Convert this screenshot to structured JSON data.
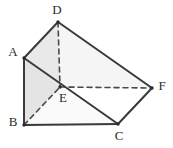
{
  "figure": {
    "kind": "triangular-prism-diagram",
    "background_color": "#ffffff",
    "edge_color": "#3a3a3a",
    "hidden_edge_color": "#4a4a4a",
    "face_fill_light": "#e9e9e9",
    "face_fill_mid": "#e2e2e2",
    "face_fill_pale": "#fbfbfb",
    "label_color": "#2b2b2b",
    "vertices": {
      "A": {
        "label": "A",
        "x": 24,
        "y": 58,
        "label_x": 13,
        "label_y": 53
      },
      "B": {
        "label": "B",
        "x": 24,
        "y": 125,
        "label_x": 13,
        "label_y": 123
      },
      "C": {
        "label": "C",
        "x": 118,
        "y": 124,
        "label_x": 119,
        "label_y": 137
      },
      "D": {
        "label": "D",
        "x": 58,
        "y": 22,
        "label_x": 57,
        "label_y": 11
      },
      "E": {
        "label": "E",
        "x": 60,
        "y": 87,
        "label_x": 63,
        "label_y": 99
      },
      "F": {
        "label": "F",
        "x": 152,
        "y": 88,
        "label_x": 162,
        "label_y": 87
      }
    },
    "solid_edges": [
      "A-D",
      "A-B",
      "A-C",
      "B-C",
      "C-F",
      "D-F"
    ],
    "hidden_edges": [
      "D-E",
      "B-E",
      "E-F"
    ],
    "faces": [
      {
        "name": "face-A-D-E",
        "points": "24,58 58,22 60,87",
        "fill": "#e9e9e9"
      },
      {
        "name": "face-A-E-B",
        "points": "24,58 60,87 24,125",
        "fill": "#e4e4e4"
      },
      {
        "name": "face-B-E-C",
        "points": "24,125 60,87 118,124",
        "fill": "#fafafa"
      },
      {
        "name": "face-D-E-C-F",
        "points": "58,22 60,87 152,88",
        "fill": "#f4f4f4"
      }
    ]
  }
}
